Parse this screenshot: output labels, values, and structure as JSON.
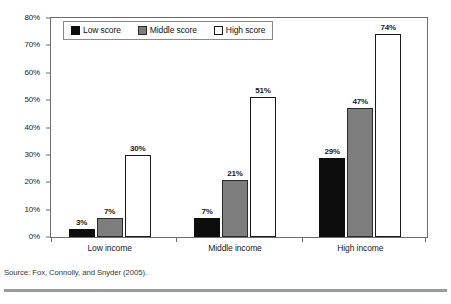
{
  "chart_data": {
    "type": "bar",
    "title": "",
    "subtitle": "",
    "xlabel": "",
    "ylabel": "",
    "categories": [
      "Low income",
      "Middle income",
      "High income"
    ],
    "series": [
      {
        "name": "Low score",
        "key": "low",
        "color": "#0d0d0d",
        "values": [
          3,
          7,
          29
        ],
        "labels": [
          "3%",
          "7%",
          "29%"
        ]
      },
      {
        "name": "Middle score",
        "key": "middle",
        "color": "#7d7d7d",
        "values": [
          7,
          21,
          47
        ],
        "labels": [
          "7%",
          "21%",
          "47%"
        ]
      },
      {
        "name": "High score",
        "key": "high",
        "color": "#ffffff",
        "values": [
          30,
          51,
          74
        ],
        "labels": [
          "30%",
          "51%",
          "74%"
        ]
      }
    ],
    "ylim": [
      0,
      80
    ],
    "y_ticks": [
      0,
      10,
      20,
      30,
      40,
      50,
      60,
      70,
      80
    ],
    "y_tick_labels": [
      "0%",
      "10%",
      "20%",
      "30%",
      "40%",
      "50%",
      "60%",
      "70%",
      "80%"
    ],
    "grid": false,
    "legend_position": "top-left-inside",
    "value_labels": true,
    "units": "percent"
  },
  "legend": {
    "items": [
      {
        "label": "Low score",
        "swatch": "low"
      },
      {
        "label": "Middle score",
        "swatch": "middle"
      },
      {
        "label": "High score",
        "swatch": "high"
      }
    ]
  },
  "footer": {
    "source": "Source: Fox, Connolly, and Snyder (2005)."
  },
  "colors": {
    "low_score": "#0d0d0d",
    "middle_score": "#7d7d7d",
    "high_score": "#ffffff",
    "axis": "#6d6d6d",
    "text": "#1a1a1a",
    "rule": "#9a9aa2"
  }
}
